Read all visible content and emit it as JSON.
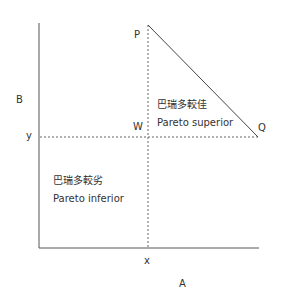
{
  "axes": {
    "x_axis_label": "A",
    "y_axis_label": "B",
    "x_tick_label": "x",
    "y_tick_label": "y"
  },
  "points": {
    "P": "P",
    "Q": "Q",
    "W": "W"
  },
  "regions": {
    "superior": {
      "zh": "巴瑞多較佳",
      "en": "Pareto superior"
    },
    "inferior": {
      "zh": "巴瑞多較劣",
      "en": "Pareto inferior"
    }
  },
  "colors": {
    "axis": "#555555",
    "dashed": "#666666",
    "frontier": "#444444",
    "text": "#333333"
  }
}
